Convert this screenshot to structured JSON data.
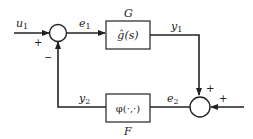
{
  "diagram": {
    "type": "feedback-block-diagram",
    "input": {
      "label": "u",
      "subscript": "1"
    },
    "blocks": [
      {
        "id": "G",
        "name": "G",
        "content": "ĝ(s)"
      },
      {
        "id": "F",
        "name": "F",
        "content": "φ(·,·)"
      }
    ],
    "signals": {
      "e1": {
        "label": "e",
        "subscript": "1"
      },
      "y1": {
        "label": "y",
        "subscript": "1"
      },
      "y2": {
        "label": "y",
        "subscript": "2"
      },
      "e2": {
        "label": "e",
        "subscript": "2"
      }
    },
    "junctions": [
      {
        "id": "sum1",
        "signs": {
          "input": "+",
          "feedback": "−"
        }
      },
      {
        "id": "sum2",
        "signs": {
          "top": "+",
          "right": "+"
        }
      }
    ]
  }
}
